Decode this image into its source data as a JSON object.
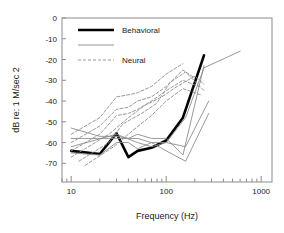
{
  "chart_data": {
    "type": "line",
    "title": "",
    "xlabel": "Frequency (Hz)",
    "ylabel": "dB re: 1 M/sec 2",
    "xscale": "log",
    "xlim": [
      8,
      1300
    ],
    "ylim": [
      -79,
      0
    ],
    "xticks": [
      10,
      100,
      1000
    ],
    "xtick_labels": [
      "10",
      "100",
      "1000"
    ],
    "yticks": [
      0,
      -10,
      -20,
      -30,
      -40,
      -50,
      -60,
      -70
    ],
    "ytick_labels": [
      "0",
      "-10",
      "-20",
      "-30",
      "-40",
      "-50",
      "-60",
      "-70"
    ],
    "grid": false,
    "legend_position": "top-left",
    "legend": [
      {
        "name": "Behavioral",
        "style": "solid",
        "color": "#000000",
        "width": 2.6
      },
      {
        "name": "",
        "style": "solid",
        "color": "#8c8c8c",
        "width": 0.9
      },
      {
        "name": "Neural",
        "style": "dashed",
        "color": "#8c8c8c",
        "width": 0.9
      }
    ],
    "series": [
      {
        "name": "Behavioral",
        "group": "behavioral",
        "style": "solid",
        "color": "#000000",
        "width": 2.6,
        "x": [
          10,
          20,
          30,
          40,
          50,
          70,
          100,
          150,
          250
        ],
        "y": [
          -64,
          -65.5,
          -55.5,
          -67,
          -64,
          -62.5,
          -59,
          -48,
          -18
        ]
      },
      {
        "name": "behavioral-individual-1",
        "group": "behavioral",
        "style": "solid",
        "color": "#8c8c8c",
        "width": 0.9,
        "x": [
          10,
          20,
          30,
          40,
          50,
          70,
          100,
          150,
          250
        ],
        "y": [
          -53,
          -57,
          -57,
          -58,
          -56,
          -58,
          -58,
          -66,
          -23
        ]
      },
      {
        "name": "behavioral-individual-2",
        "group": "behavioral",
        "style": "solid",
        "color": "#8c8c8c",
        "width": 0.9,
        "x": [
          10,
          20,
          30,
          40,
          50,
          70,
          100,
          160,
          280
        ],
        "y": [
          -58,
          -58,
          -58,
          -58,
          -58,
          -60,
          -60,
          -62,
          -40
        ]
      },
      {
        "name": "behavioral-individual-3",
        "group": "behavioral",
        "style": "solid",
        "color": "#8c8c8c",
        "width": 0.9,
        "x": [
          10,
          20,
          30,
          40,
          50,
          70,
          100,
          160,
          280
        ],
        "y": [
          -65,
          -66,
          -60,
          -60,
          -63,
          -60,
          -64,
          -69,
          -46
        ]
      },
      {
        "name": "behavioral-individual-4",
        "group": "behavioral",
        "style": "solid",
        "color": "#8c8c8c",
        "width": 0.9,
        "x": [
          10,
          30,
          50,
          70,
          100,
          160,
          250,
          600
        ],
        "y": [
          -62,
          -56,
          -60,
          -62,
          -60,
          -48,
          -24,
          -16
        ]
      },
      {
        "name": "neural-1",
        "group": "neural",
        "style": "dashed",
        "color": "#8c8c8c",
        "width": 0.9,
        "x": [
          10,
          20,
          30,
          40,
          50,
          70,
          100,
          150
        ],
        "y": [
          -56,
          -48,
          -38,
          -37,
          -36,
          -33,
          -27,
          -22
        ]
      },
      {
        "name": "neural-2",
        "group": "neural",
        "style": "dashed",
        "color": "#8c8c8c",
        "width": 0.9,
        "x": [
          10,
          20,
          30,
          40,
          50,
          70,
          100,
          150,
          200
        ],
        "y": [
          -60,
          -52,
          -44,
          -43,
          -40,
          -38,
          -33,
          -25,
          -29
        ]
      },
      {
        "name": "neural-3",
        "group": "neural",
        "style": "dashed",
        "color": "#8c8c8c",
        "width": 0.9,
        "x": [
          10,
          20,
          30,
          40,
          50,
          70,
          100,
          150,
          220
        ],
        "y": [
          -64,
          -56,
          -47,
          -46,
          -44,
          -40,
          -35,
          -30,
          -33
        ]
      },
      {
        "name": "neural-4",
        "group": "neural",
        "style": "dashed",
        "color": "#8c8c8c",
        "width": 0.9,
        "x": [
          10,
          25,
          40,
          60,
          90,
          130,
          200,
          250
        ],
        "y": [
          -67,
          -56,
          -48,
          -42,
          -38,
          -33,
          -28,
          -32
        ]
      },
      {
        "name": "neural-5",
        "group": "neural",
        "style": "dashed",
        "color": "#8c8c8c",
        "width": 0.9,
        "x": [
          12,
          25,
          35,
          55,
          80,
          110,
          160,
          250
        ],
        "y": [
          -69,
          -60,
          -51,
          -46,
          -41,
          -31,
          -26,
          -35
        ]
      },
      {
        "name": "neural-6",
        "group": "neural",
        "style": "dashed",
        "color": "#8c8c8c",
        "width": 0.9,
        "x": [
          14,
          28,
          45,
          70,
          100,
          150,
          230
        ],
        "y": [
          -71,
          -62,
          -54,
          -47,
          -40,
          -34,
          -37
        ]
      }
    ]
  },
  "axes": {
    "frame_color": "#8c8c8c"
  }
}
